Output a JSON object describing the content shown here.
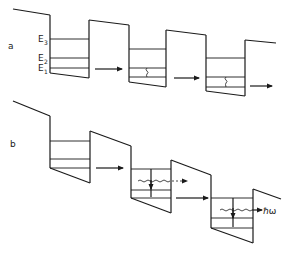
{
  "diagram": {
    "type": "quantum cascade band diagram",
    "parts": [
      {
        "id": "a",
        "label": "a",
        "energy_levels": [
          {
            "name": "E",
            "sub": "3"
          },
          {
            "name": "E",
            "sub": "2"
          },
          {
            "name": "E",
            "sub": "1"
          }
        ],
        "description": "Tilted superlattice with three quantum wells; electrons relax non-radiatively (E2 to E1) and tunnel to next well"
      },
      {
        "id": "b",
        "label": "b",
        "photon_label": "ℏω",
        "description": "Cascade with radiative transitions; wavy lines indicate photon emission"
      }
    ]
  },
  "labels": {
    "part_a": "a",
    "part_b": "b",
    "e3": "E",
    "e3_sub": "3",
    "e2": "E",
    "e2_sub": "2",
    "e1": "E",
    "e1_sub": "1",
    "photon": "ℏω"
  }
}
